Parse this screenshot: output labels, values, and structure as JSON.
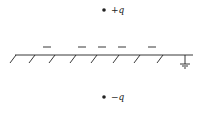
{
  "diagram": {
    "title": "",
    "colors": {
      "ink": "#222222",
      "background": "#ffffff"
    },
    "charges": [
      {
        "label": "+q",
        "x": 104,
        "y": 10
      },
      {
        "label": "−q",
        "x": 104,
        "y": 97
      }
    ],
    "induced_charges": {
      "symbol": "−",
      "positions_x": [
        47,
        82,
        102,
        122,
        152
      ],
      "y": 47
    },
    "plane": {
      "y": 55,
      "x_start": 15,
      "x_end": 193,
      "hatch_x": [
        17,
        35,
        55,
        75,
        97,
        117,
        140,
        163
      ]
    },
    "ground": {
      "x": 185,
      "y": 55,
      "label": "ground-symbol"
    }
  }
}
